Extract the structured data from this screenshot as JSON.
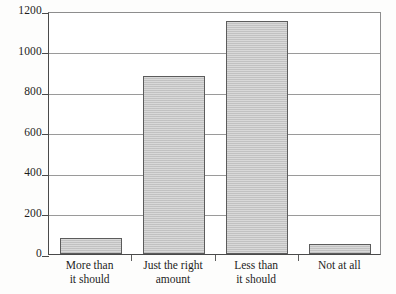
{
  "chart_data": {
    "type": "bar",
    "title": "",
    "subtitle": "",
    "xlabel": "",
    "ylabel": "",
    "categories": [
      "More than\nit should",
      "Just the right\namount",
      "Less than\nit should",
      "Not at all"
    ],
    "values": [
      80,
      880,
      1150,
      50
    ],
    "ylim": [
      0,
      1200
    ],
    "ytick_labels": [
      "0",
      "200",
      "400",
      "600",
      "800",
      "1000",
      "1200"
    ],
    "ytick_values": [
      0,
      200,
      400,
      600,
      800,
      1000,
      1200
    ],
    "grid": true,
    "legend": false,
    "legend_position": "none",
    "bar_color": "#c9c9c9",
    "bar_edge_color": "#5c5c5c",
    "axis_color": "#4a4a4a",
    "grid_color": "#9a9a9a",
    "background_color": "#ffffff"
  }
}
